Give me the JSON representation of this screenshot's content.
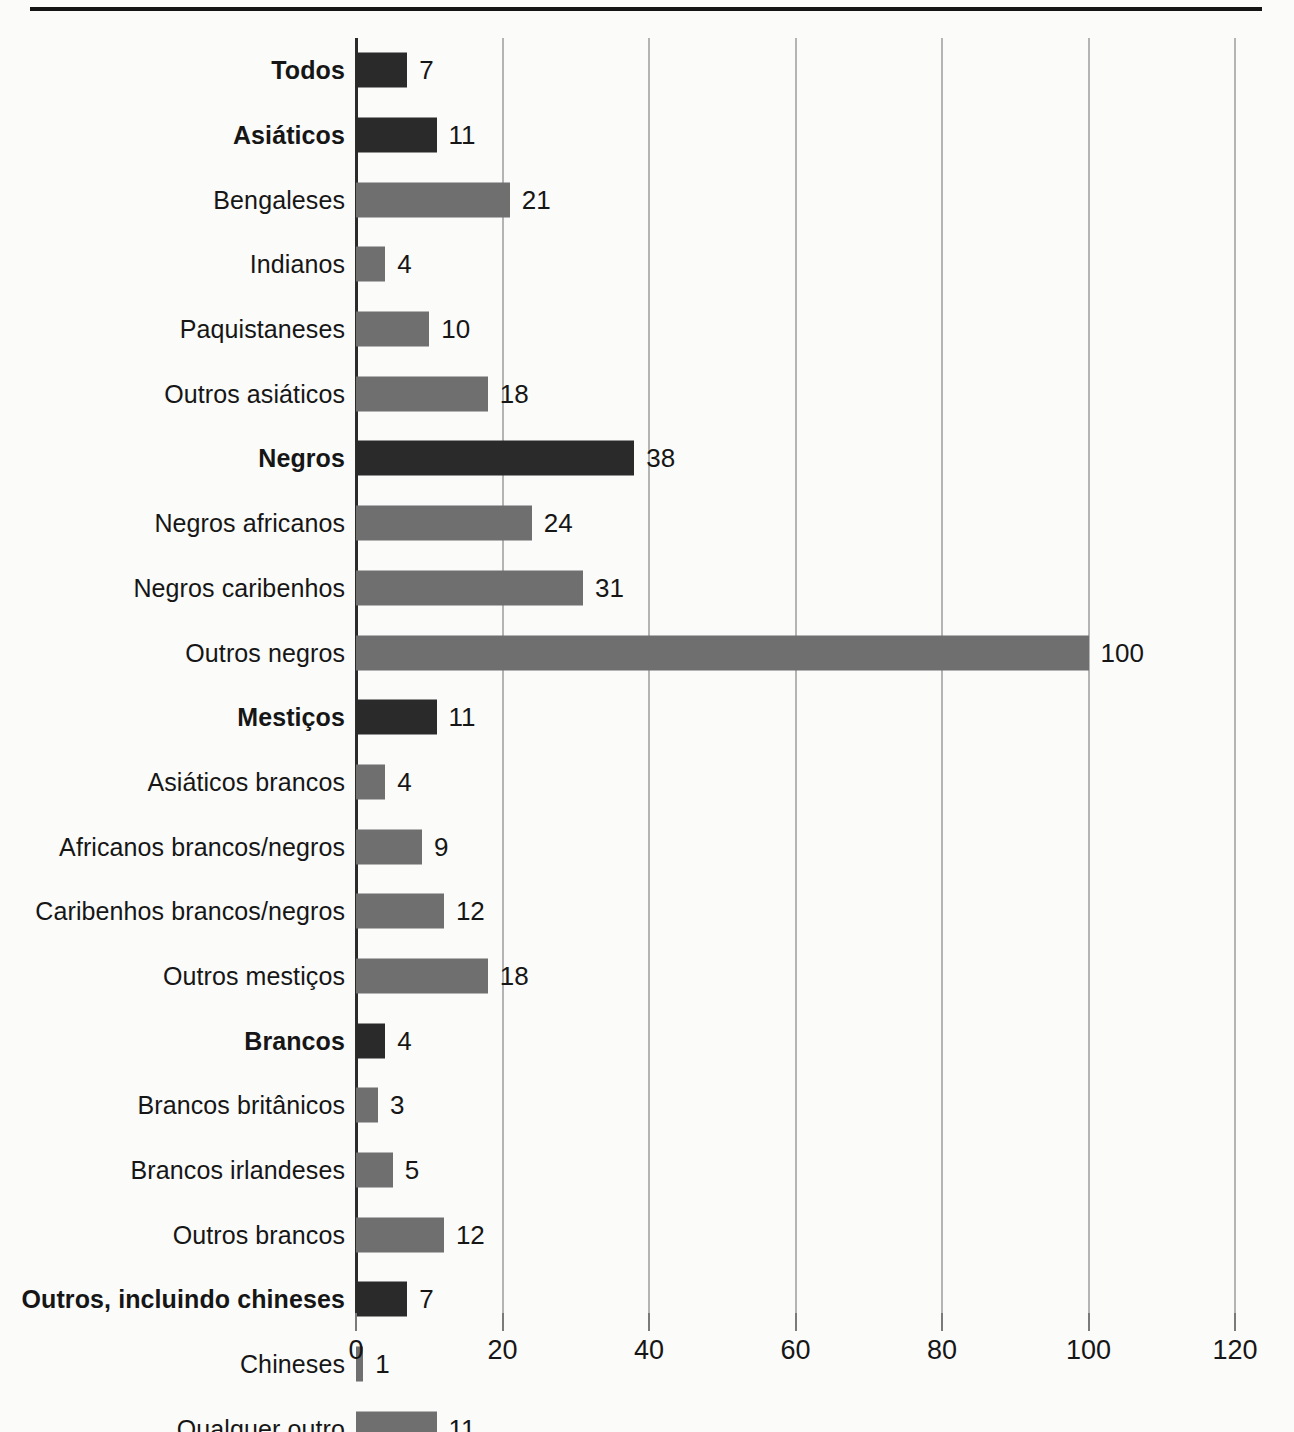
{
  "chart_data": {
    "type": "bar",
    "orientation": "horizontal",
    "title": "",
    "xlabel": "",
    "ylabel": "",
    "xlim": [
      0,
      120
    ],
    "xticks": [
      0,
      20,
      40,
      60,
      80,
      100,
      120
    ],
    "xtick_labels": [
      "0",
      "20",
      "40",
      "60",
      "80",
      "100",
      "120"
    ],
    "grid": "vertical",
    "legend": "none",
    "colors": {
      "major": "#2a2a2a",
      "sub": "#6f6f6f",
      "gridline": "#b4b4b4",
      "axis": "#2b2b2b",
      "background": "#fbfbfa",
      "text": "#161616"
    },
    "categories": [
      "Todos",
      "Asiáticos",
      "Bengaleses",
      "Indianos",
      "Paquistaneses",
      "Outros asiáticos",
      "Negros",
      "Negros africanos",
      "Negros caribenhos",
      "Outros negros",
      "Mestiços",
      "Asiáticos brancos",
      "Africanos brancos/negros",
      "Caribenhos brancos/negros",
      "Outros mestiços",
      "Brancos",
      "Brancos britânicos",
      "Brancos irlandeses",
      "Outros brancos",
      "Outros, incluindo chineses",
      "Chineses",
      "Qualquer outro"
    ],
    "values": [
      7,
      11,
      21,
      4,
      10,
      18,
      38,
      24,
      31,
      100,
      11,
      4,
      9,
      12,
      18,
      4,
      3,
      5,
      12,
      7,
      1,
      11
    ],
    "rows": [
      {
        "label": "Todos",
        "value": 7,
        "value_label": "7",
        "major": true
      },
      {
        "label": "Asiáticos",
        "value": 11,
        "value_label": "11",
        "major": true
      },
      {
        "label": "Bengaleses",
        "value": 21,
        "value_label": "21",
        "major": false
      },
      {
        "label": "Indianos",
        "value": 4,
        "value_label": "4",
        "major": false
      },
      {
        "label": "Paquistaneses",
        "value": 10,
        "value_label": "10",
        "major": false
      },
      {
        "label": "Outros asiáticos",
        "value": 18,
        "value_label": "18",
        "major": false
      },
      {
        "label": "Negros",
        "value": 38,
        "value_label": "38",
        "major": true
      },
      {
        "label": "Negros africanos",
        "value": 24,
        "value_label": "24",
        "major": false
      },
      {
        "label": "Negros caribenhos",
        "value": 31,
        "value_label": "31",
        "major": false
      },
      {
        "label": "Outros negros",
        "value": 100,
        "value_label": "100",
        "major": false
      },
      {
        "label": "Mestiços",
        "value": 11,
        "value_label": "11",
        "major": true
      },
      {
        "label": "Asiáticos brancos",
        "value": 4,
        "value_label": "4",
        "major": false
      },
      {
        "label": "Africanos brancos/negros",
        "value": 9,
        "value_label": "9",
        "major": false
      },
      {
        "label": "Caribenhos brancos/negros",
        "value": 12,
        "value_label": "12",
        "major": false
      },
      {
        "label": "Outros mestiços",
        "value": 18,
        "value_label": "18",
        "major": false
      },
      {
        "label": "Brancos",
        "value": 4,
        "value_label": "4",
        "major": true
      },
      {
        "label": "Brancos britânicos",
        "value": 3,
        "value_label": "3",
        "major": false
      },
      {
        "label": "Brancos irlandeses",
        "value": 5,
        "value_label": "5",
        "major": false
      },
      {
        "label": "Outros brancos",
        "value": 12,
        "value_label": "12",
        "major": false
      },
      {
        "label": "Outros, incluindo chineses",
        "value": 7,
        "value_label": "7",
        "major": true
      },
      {
        "label": "Chineses",
        "value": 1,
        "value_label": "1",
        "major": false
      },
      {
        "label": "Qualquer outro",
        "value": 11,
        "value_label": "11",
        "major": false
      }
    ]
  }
}
